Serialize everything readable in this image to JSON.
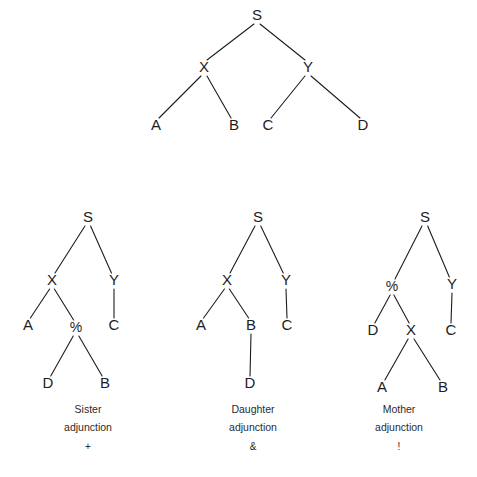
{
  "figure": {
    "background_color": "#ffffff",
    "ink_color": "#1d1d1d"
  },
  "trees": [
    {
      "id": "base-tree",
      "name": "base-phrase-structure-tree",
      "caption": null,
      "nodes": [
        {
          "id": "s",
          "label": "S",
          "x": 257,
          "y": 20
        },
        {
          "id": "x",
          "label": "X",
          "x": 204,
          "y": 72
        },
        {
          "id": "y",
          "label": "Y",
          "x": 308,
          "y": 72
        },
        {
          "id": "a",
          "label": "A",
          "x": 156,
          "y": 130
        },
        {
          "id": "b",
          "label": "B",
          "x": 234,
          "y": 130
        },
        {
          "id": "c",
          "label": "C",
          "x": 268,
          "y": 130
        },
        {
          "id": "d",
          "label": "D",
          "x": 363,
          "y": 130
        }
      ],
      "edges": [
        {
          "from": "s",
          "to": "x"
        },
        {
          "from": "s",
          "to": "y"
        },
        {
          "from": "x",
          "to": "a"
        },
        {
          "from": "x",
          "to": "b"
        },
        {
          "from": "y",
          "to": "c"
        },
        {
          "from": "y",
          "to": "d"
        }
      ]
    },
    {
      "id": "sister-tree",
      "name": "sister-adjunction-tree",
      "caption": {
        "line1": "Sister",
        "line2": "adjunction",
        "symbol": "+",
        "x": 88,
        "y1": 413,
        "y2": 431,
        "y3": 450
      },
      "nodes": [
        {
          "id": "s",
          "label": "S",
          "x": 88,
          "y": 222
        },
        {
          "id": "x",
          "label": "X",
          "x": 52,
          "y": 285
        },
        {
          "id": "y",
          "label": "Y",
          "x": 114,
          "y": 285
        },
        {
          "id": "a",
          "label": "A",
          "x": 28,
          "y": 330
        },
        {
          "id": "pct",
          "label": "%",
          "x": 76,
          "y": 332
        },
        {
          "id": "c",
          "label": "C",
          "x": 114,
          "y": 330
        },
        {
          "id": "d",
          "label": "D",
          "x": 48,
          "y": 388
        },
        {
          "id": "b",
          "label": "B",
          "x": 105,
          "y": 388
        }
      ],
      "edges": [
        {
          "from": "s",
          "to": "x"
        },
        {
          "from": "s",
          "to": "y"
        },
        {
          "from": "x",
          "to": "a"
        },
        {
          "from": "x",
          "to": "pct"
        },
        {
          "from": "y",
          "to": "c"
        },
        {
          "from": "pct",
          "to": "d"
        },
        {
          "from": "pct",
          "to": "b"
        }
      ]
    },
    {
      "id": "daughter-tree",
      "name": "daughter-adjunction-tree",
      "caption": {
        "line1": "Daughter",
        "line2": "adjunction",
        "symbol": "&",
        "x": 253,
        "y1": 413,
        "y2": 431,
        "y3": 450
      },
      "nodes": [
        {
          "id": "s",
          "label": "S",
          "x": 258,
          "y": 222
        },
        {
          "id": "x",
          "label": "X",
          "x": 227,
          "y": 285
        },
        {
          "id": "y",
          "label": "Y",
          "x": 286,
          "y": 285
        },
        {
          "id": "a",
          "label": "A",
          "x": 201,
          "y": 330
        },
        {
          "id": "b",
          "label": "B",
          "x": 251,
          "y": 330
        },
        {
          "id": "c",
          "label": "C",
          "x": 287,
          "y": 330
        },
        {
          "id": "d",
          "label": "D",
          "x": 250,
          "y": 388
        }
      ],
      "edges": [
        {
          "from": "s",
          "to": "x"
        },
        {
          "from": "s",
          "to": "y"
        },
        {
          "from": "x",
          "to": "a"
        },
        {
          "from": "x",
          "to": "b"
        },
        {
          "from": "y",
          "to": "c"
        },
        {
          "from": "b",
          "to": "d"
        }
      ]
    },
    {
      "id": "mother-tree",
      "name": "mother-adjunction-tree",
      "caption": {
        "line1": "Mother",
        "line2": "adjunction",
        "symbol": "!",
        "x": 399,
        "y1": 413,
        "y2": 431,
        "y3": 450
      },
      "nodes": [
        {
          "id": "s",
          "label": "S",
          "x": 425,
          "y": 222
        },
        {
          "id": "pct",
          "label": "%",
          "x": 392,
          "y": 291
        },
        {
          "id": "y",
          "label": "Y",
          "x": 452,
          "y": 289
        },
        {
          "id": "d",
          "label": "D",
          "x": 373,
          "y": 335
        },
        {
          "id": "x",
          "label": "X",
          "x": 411,
          "y": 335
        },
        {
          "id": "c",
          "label": "C",
          "x": 451,
          "y": 335
        },
        {
          "id": "a",
          "label": "A",
          "x": 382,
          "y": 392
        },
        {
          "id": "b",
          "label": "B",
          "x": 443,
          "y": 392
        }
      ],
      "edges": [
        {
          "from": "s",
          "to": "pct"
        },
        {
          "from": "s",
          "to": "y"
        },
        {
          "from": "pct",
          "to": "d"
        },
        {
          "from": "pct",
          "to": "x"
        },
        {
          "from": "y",
          "to": "c"
        },
        {
          "from": "x",
          "to": "a"
        },
        {
          "from": "x",
          "to": "b"
        }
      ]
    }
  ]
}
